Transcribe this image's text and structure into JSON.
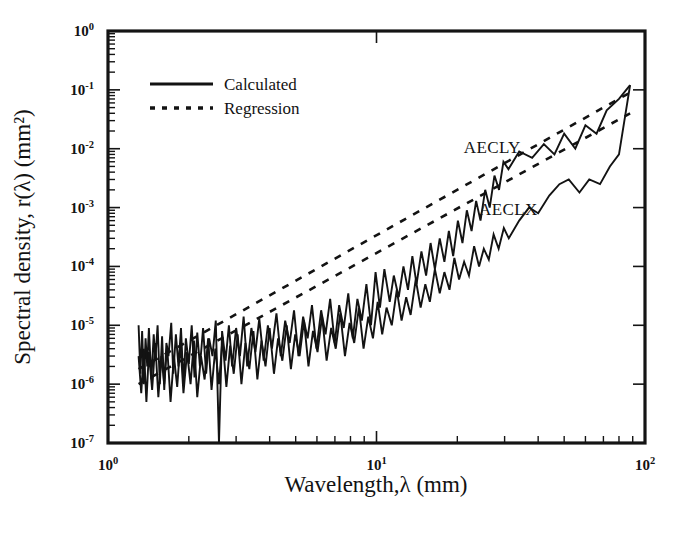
{
  "figure": {
    "background": "#ffffff",
    "ink_color": "#131313"
  },
  "chart_data": {
    "type": "line",
    "title": "",
    "xlabel": "Wavelength,λ (mm)",
    "ylabel": "Spectral density, r(λ) (mm²)",
    "xscale": "log",
    "yscale": "log",
    "xlim": [
      1,
      100
    ],
    "ylim": [
      1e-07,
      1
    ],
    "grid": false,
    "xticks": [
      1,
      10,
      100
    ],
    "xtick_labels": [
      "10⁰",
      "10¹",
      "10²"
    ],
    "xtick_mantissa": [
      "10",
      "10",
      "10"
    ],
    "xtick_exponents": [
      "0",
      "1",
      "2"
    ],
    "yticks": [
      1,
      0.1,
      0.01,
      0.001,
      0.0001,
      1e-05,
      1e-06,
      1e-07
    ],
    "ytick_labels": [
      "10⁰",
      "10⁻¹",
      "10⁻²",
      "10⁻³",
      "10⁻⁴",
      "10⁻⁵",
      "10⁻⁶",
      "10⁻⁷"
    ],
    "ytick_mantissa": [
      "10",
      "10",
      "10",
      "10",
      "10",
      "10",
      "10",
      "10"
    ],
    "ytick_exponents": [
      "0",
      "-1",
      "-2",
      "-3",
      "-4",
      "-5",
      "-6",
      "-7"
    ],
    "minor_ticks": true,
    "legend": {
      "position": "top-left-inside",
      "entries": [
        {
          "label": "Calculated",
          "style": "solid"
        },
        {
          "label": "Regression",
          "style": "dashed"
        }
      ]
    },
    "annotations": [
      {
        "text": "AECLY",
        "x": 27,
        "y": 0.0085
      },
      {
        "text": "AECLX",
        "x": 31,
        "y": 0.00075
      }
    ],
    "series": [
      {
        "name": "AECLY Calculated",
        "style": "solid",
        "points": [
          [
            1.3,
            1e-05
          ],
          [
            1.32,
            1.5e-06
          ],
          [
            1.34,
            8e-06
          ],
          [
            1.36,
            1e-06
          ],
          [
            1.38,
            6e-06
          ],
          [
            1.4,
            2e-06
          ],
          [
            1.42,
            9e-06
          ],
          [
            1.45,
            1.2e-06
          ],
          [
            1.48,
            7e-06
          ],
          [
            1.5,
            2.5e-06
          ],
          [
            1.53,
            1e-05
          ],
          [
            1.56,
            1e-06
          ],
          [
            1.59,
            6.5e-06
          ],
          [
            1.62,
            8e-07
          ],
          [
            1.65,
            5e-06
          ],
          [
            1.68,
            3e-06
          ],
          [
            1.72,
            1.1e-05
          ],
          [
            1.75,
            1.5e-06
          ],
          [
            1.79,
            7e-06
          ],
          [
            1.83,
            2e-06
          ],
          [
            1.87,
            9e-06
          ],
          [
            1.91,
            1e-06
          ],
          [
            1.95,
            6e-06
          ],
          [
            2.0,
            2.2e-06
          ],
          [
            2.05,
            1e-05
          ],
          [
            2.1,
            1.3e-06
          ],
          [
            2.15,
            7.5e-06
          ],
          [
            2.2,
            2e-06
          ],
          [
            2.26,
            9e-06
          ],
          [
            2.32,
            1.5e-06
          ],
          [
            2.38,
            6e-06
          ],
          [
            2.45,
            3e-06
          ],
          [
            2.52,
            1.2e-05
          ],
          [
            2.59,
            1e-07
          ],
          [
            2.66,
            8e-06
          ],
          [
            2.74,
            2.5e-06
          ],
          [
            2.82,
            1e-05
          ],
          [
            2.9,
            2e-06
          ],
          [
            3.0,
            9e-06
          ],
          [
            3.1,
            3e-06
          ],
          [
            3.2,
            1.4e-05
          ],
          [
            3.3,
            2e-06
          ],
          [
            3.42,
            9e-06
          ],
          [
            3.54,
            3.5e-06
          ],
          [
            3.66,
            1.3e-05
          ],
          [
            3.8,
            2.5e-06
          ],
          [
            3.94,
            1e-05
          ],
          [
            4.08,
            4e-06
          ],
          [
            4.24,
            1.6e-05
          ],
          [
            4.4,
            3e-06
          ],
          [
            4.57,
            1.2e-05
          ],
          [
            4.75,
            5e-06
          ],
          [
            4.93,
            1.8e-05
          ],
          [
            5.12,
            3e-06
          ],
          [
            5.33,
            1.4e-05
          ],
          [
            5.54,
            6e-06
          ],
          [
            5.75,
            2.2e-05
          ],
          [
            5.98,
            4e-06
          ],
          [
            6.22,
            1.8e-05
          ],
          [
            6.46,
            7e-06
          ],
          [
            6.72,
            2.8e-05
          ],
          [
            6.99,
            5e-06
          ],
          [
            7.26,
            2.2e-05
          ],
          [
            7.55,
            9e-06
          ],
          [
            7.85,
            3.5e-05
          ],
          [
            8.16,
            6e-06
          ],
          [
            8.49,
            2.8e-05
          ],
          [
            8.82,
            1.2e-05
          ],
          [
            9.17,
            5e-05
          ],
          [
            9.54,
            1e-05
          ],
          [
            9.92,
            8e-05
          ],
          [
            10.3,
            2e-05
          ],
          [
            10.7,
            9e-05
          ],
          [
            11.2,
            2.5e-05
          ],
          [
            11.6,
            7e-05
          ],
          [
            12.1,
            3e-05
          ],
          [
            12.6,
            0.0001
          ],
          [
            13.1,
            4e-05
          ],
          [
            13.6,
            0.00015
          ],
          [
            14.1,
            5e-05
          ],
          [
            14.7,
            0.00018
          ],
          [
            15.3,
            7e-05
          ],
          [
            15.9,
            0.00025
          ],
          [
            16.5,
            9e-05
          ],
          [
            17.2,
            0.0003
          ],
          [
            17.9,
            0.00012
          ],
          [
            18.6,
            0.0004
          ],
          [
            19.3,
            0.00015
          ],
          [
            20.1,
            0.0006
          ],
          [
            20.9,
            0.00025
          ],
          [
            21.7,
            0.0009
          ],
          [
            22.6,
            0.0004
          ],
          [
            23.5,
            0.0013
          ],
          [
            24.4,
            0.0006
          ],
          [
            25.4,
            0.002
          ],
          [
            26.4,
            0.001
          ],
          [
            27.5,
            0.0035
          ],
          [
            28.6,
            0.002
          ],
          [
            29.7,
            0.006
          ],
          [
            31.0,
            0.0045
          ],
          [
            34.0,
            0.009
          ],
          [
            38.0,
            0.007
          ],
          [
            42.0,
            0.012
          ],
          [
            46.0,
            0.008
          ],
          [
            50.0,
            0.018
          ],
          [
            55.0,
            0.01
          ],
          [
            60.0,
            0.025
          ],
          [
            66.0,
            0.018
          ],
          [
            72.0,
            0.045
          ],
          [
            80.0,
            0.07
          ],
          [
            88.0,
            0.12
          ]
        ]
      },
      {
        "name": "AECLX Calculated",
        "style": "solid",
        "points": [
          [
            1.3,
            3e-06
          ],
          [
            1.33,
            7e-07
          ],
          [
            1.36,
            4e-06
          ],
          [
            1.39,
            5e-07
          ],
          [
            1.42,
            3.5e-06
          ],
          [
            1.46,
            8e-07
          ],
          [
            1.5,
            5e-06
          ],
          [
            1.54,
            6e-07
          ],
          [
            1.58,
            3e-06
          ],
          [
            1.62,
            1e-06
          ],
          [
            1.66,
            4.5e-06
          ],
          [
            1.71,
            5e-07
          ],
          [
            1.76,
            3e-06
          ],
          [
            1.81,
            9e-07
          ],
          [
            1.86,
            5e-06
          ],
          [
            1.91,
            7e-07
          ],
          [
            1.97,
            3.5e-06
          ],
          [
            2.03,
            1e-06
          ],
          [
            2.09,
            5.5e-06
          ],
          [
            2.15,
            6e-07
          ],
          [
            2.22,
            3e-06
          ],
          [
            2.29,
            1.2e-06
          ],
          [
            2.36,
            6e-06
          ],
          [
            2.43,
            8e-07
          ],
          [
            2.51,
            4e-06
          ],
          [
            2.59,
            1e-06
          ],
          [
            2.67,
            6e-06
          ],
          [
            2.76,
            9e-07
          ],
          [
            2.85,
            4.5e-06
          ],
          [
            2.94,
            1.5e-06
          ],
          [
            3.04,
            7e-06
          ],
          [
            3.14,
            1e-06
          ],
          [
            3.25,
            5e-06
          ],
          [
            3.36,
            1.8e-06
          ],
          [
            3.48,
            8e-06
          ],
          [
            3.6,
            1.2e-06
          ],
          [
            3.73,
            5.5e-06
          ],
          [
            3.86,
            2e-06
          ],
          [
            4.0,
            9e-06
          ],
          [
            4.15,
            1.5e-06
          ],
          [
            4.3,
            6e-06
          ],
          [
            4.46,
            2.5e-06
          ],
          [
            4.63,
            1e-05
          ],
          [
            4.8,
            1.8e-06
          ],
          [
            4.98,
            7e-06
          ],
          [
            5.17,
            3e-06
          ],
          [
            5.37,
            1.2e-05
          ],
          [
            5.58,
            2e-06
          ],
          [
            5.8,
            8e-06
          ],
          [
            6.03,
            3.5e-06
          ],
          [
            6.27,
            1.4e-05
          ],
          [
            6.52,
            2.5e-06
          ],
          [
            6.78,
            9e-06
          ],
          [
            7.05,
            4e-06
          ],
          [
            7.33,
            1.6e-05
          ],
          [
            7.63,
            3e-06
          ],
          [
            7.94,
            1.1e-05
          ],
          [
            8.26,
            5e-06
          ],
          [
            8.6,
            2e-05
          ],
          [
            8.95,
            4e-06
          ],
          [
            9.32,
            1.4e-05
          ],
          [
            9.7,
            6e-06
          ],
          [
            10.1,
            2.5e-05
          ],
          [
            10.5,
            7e-06
          ],
          [
            10.9,
            2e-05
          ],
          [
            11.4,
            1e-05
          ],
          [
            11.9,
            4e-05
          ],
          [
            12.4,
            1.2e-05
          ],
          [
            12.9,
            3e-05
          ],
          [
            13.4,
            1.5e-05
          ],
          [
            14.0,
            6e-05
          ],
          [
            14.6,
            2e-05
          ],
          [
            15.2,
            5e-05
          ],
          [
            15.8,
            2.5e-05
          ],
          [
            16.5,
            9e-05
          ],
          [
            17.2,
            3.5e-05
          ],
          [
            17.9,
            8e-05
          ],
          [
            18.7,
            4e-05
          ],
          [
            19.5,
            0.00014
          ],
          [
            20.3,
            6e-05
          ],
          [
            21.2,
            0.00012
          ],
          [
            22.1,
            7e-05
          ],
          [
            23.1,
            0.00022
          ],
          [
            24.1,
            0.0001
          ],
          [
            25.1,
            0.0002
          ],
          [
            26.2,
            0.00013
          ],
          [
            27.3,
            0.00035
          ],
          [
            28.5,
            0.0002
          ],
          [
            29.8,
            0.00045
          ],
          [
            31.1,
            0.0003
          ],
          [
            34.0,
            0.0006
          ],
          [
            37.0,
            0.001
          ],
          [
            40.0,
            0.0008
          ],
          [
            44.0,
            0.0016
          ],
          [
            48.0,
            0.0025
          ],
          [
            52.0,
            0.003
          ],
          [
            57.0,
            0.0018
          ],
          [
            62.0,
            0.003
          ],
          [
            68.0,
            0.0025
          ],
          [
            74.0,
            0.005
          ],
          [
            80.0,
            0.008
          ],
          [
            88.0,
            0.12
          ]
        ]
      },
      {
        "name": "AECLY Regression",
        "style": "dashed",
        "points": [
          [
            1.3,
            1.8e-06
          ],
          [
            88.0,
            0.09
          ]
        ]
      },
      {
        "name": "AECLX Regression",
        "style": "dashed",
        "points": [
          [
            1.3,
            1e-06
          ],
          [
            88.0,
            0.04
          ]
        ]
      }
    ]
  }
}
